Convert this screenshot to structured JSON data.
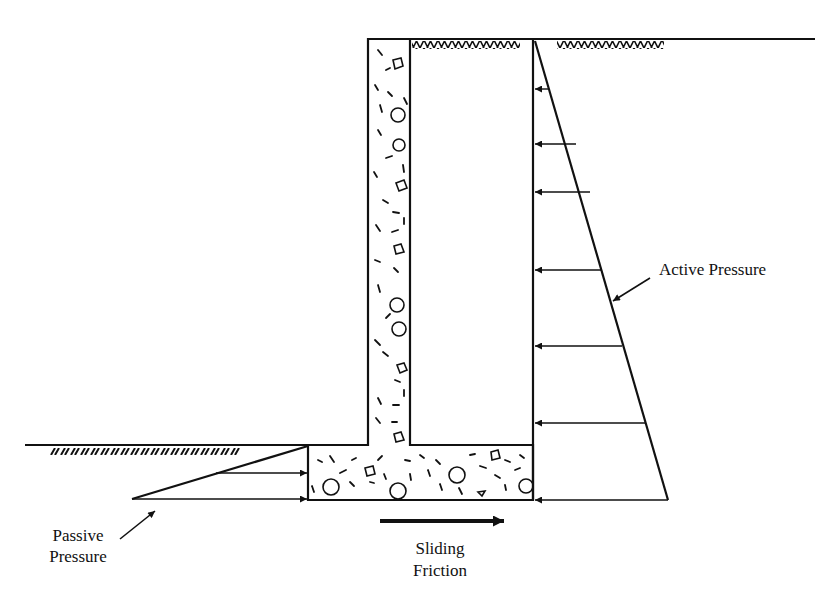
{
  "figure": {
    "labels": {
      "active_pressure": "Active Pressure",
      "passive_pressure_line1": "Passive",
      "passive_pressure_line2": "Pressure",
      "sliding_friction_line1": "Sliding",
      "sliding_friction_line2": "Friction"
    },
    "colors": {
      "ink": "#111111",
      "background": "#ffffff"
    },
    "geometry": {
      "stem": {
        "x1": 368,
        "x2": 410,
        "y_top": 39,
        "y_bottom": 445
      },
      "base": {
        "x1": 308,
        "x2": 533,
        "y_top": 445,
        "y_bottom": 500
      },
      "backfill_face_x": 533,
      "ground_right": {
        "x1": 368,
        "x2": 815,
        "y": 39
      },
      "ground_left": {
        "x1": 25,
        "x2": 308,
        "y": 445
      },
      "active_triangle": {
        "top": [
          535,
          41
        ],
        "bottom": [
          668,
          500
        ]
      },
      "passive_triangle": {
        "top": [
          308,
          446
        ],
        "tip": [
          132,
          499
        ]
      },
      "active_arrows_y": [
        89,
        144,
        192,
        270,
        346,
        423,
        500
      ],
      "passive_arrows_y": [
        473,
        499
      ],
      "sliding_arrow": {
        "x1": 380,
        "x2": 504,
        "y": 521
      }
    }
  }
}
